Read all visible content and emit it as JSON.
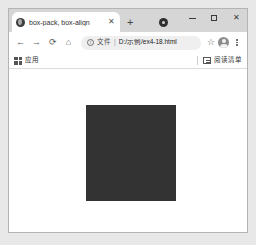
{
  "window": {
    "controls": {
      "minimize_label": "—",
      "maximize_label": "□",
      "close_label": "✕"
    }
  },
  "tabstrip": {
    "tabs": [
      {
        "title": "box-pack, box-align",
        "favicon": "globe-icon",
        "close_label": "✕",
        "active": true
      }
    ],
    "new_tab_label": "+",
    "extra_icon": "profile-circle-icon"
  },
  "toolbar": {
    "back_label": "←",
    "forward_label": "→",
    "reload_label": "⟳",
    "home_label": "⌂",
    "omnibox": {
      "info_icon_label": "i",
      "scheme_label": "文件",
      "separator": "|",
      "url": "D:/示例/ex4-18.html"
    },
    "bookmark_star_label": "☆",
    "avatar": "account-avatar",
    "menu_label": "kebab-menu"
  },
  "bookmarks_bar": {
    "apps_label": "应用",
    "reading_list_label": "阅读清单"
  },
  "page": {
    "background": "#ffffff",
    "box": {
      "color": "#333333",
      "width": 90,
      "height": 96
    }
  }
}
